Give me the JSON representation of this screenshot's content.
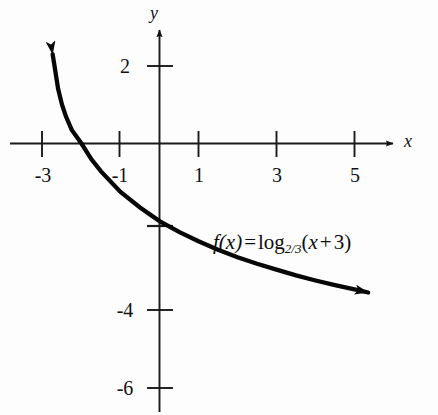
{
  "figure": {
    "kind": "cartesian-graph",
    "background_color": "#fdfdfd",
    "ink_color": "#111111"
  },
  "axes": {
    "x_axis_label": "x",
    "y_axis_label": "y",
    "x_tick_labels": [
      "-3",
      "-1",
      "1",
      "3",
      "5"
    ],
    "y_tick_labels": [
      "2",
      "-4",
      "-6"
    ]
  },
  "annotation": {
    "f_of_x": "f(x)",
    "equals": "=",
    "log": "log",
    "base": "2/3",
    "argument_open": "(",
    "argument_var": "x",
    "argument_plus": "+",
    "argument_const": "3",
    "argument_close": ")",
    "full_text": "f(x) = log_2/3 (x + 3)"
  },
  "chart_data": {
    "type": "line",
    "title": "",
    "xlabel": "x",
    "ylabel": "y",
    "grid": false,
    "legend": null,
    "xlim": [
      -3.9,
      6.1
    ],
    "ylim": [
      -7.0,
      3.0
    ],
    "xticks": [
      -3,
      -1,
      1,
      3,
      5
    ],
    "xtick_labels": [
      "-3",
      "-1",
      "1",
      "3",
      "5"
    ],
    "yticks": [
      2,
      -2,
      -4,
      -6
    ],
    "ytick_labels": [
      "2",
      "",
      "-4",
      "-6"
    ],
    "annotations": [
      {
        "text": "f(x) = log_{2/3}(x + 3)",
        "x": 1.45,
        "y": -2.6
      }
    ],
    "series": [
      {
        "name": "f(x) = log_2/3 (x + 3)",
        "formula": "log base 2/3 of (x + 3)",
        "color": "#000000",
        "arrow_start": true,
        "arrow_end": true,
        "x": [
          -2.74,
          -2.7,
          -2.6,
          -2.5,
          -2.4,
          -2.25,
          -2.0,
          -1.75,
          -1.5,
          -1.0,
          -0.5,
          0.0,
          0.5,
          1.0,
          1.5,
          2.0,
          2.5,
          3.0,
          3.5,
          4.0,
          4.5,
          5.0,
          5.35
        ],
        "y": [
          2.3,
          2.05,
          1.41,
          1.0,
          0.7,
          0.35,
          0.0,
          -0.4,
          -0.72,
          -1.25,
          -1.65,
          -2.0,
          -2.28,
          -2.52,
          -2.74,
          -2.93,
          -3.1,
          -3.25,
          -3.4,
          -3.53,
          -3.65,
          -3.76,
          -3.84
        ]
      }
    ]
  }
}
